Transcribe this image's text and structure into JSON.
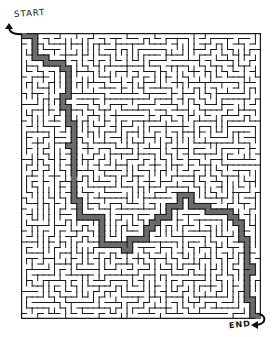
{
  "puzzle": {
    "type": "maze",
    "start_label": "START",
    "end_label": "END",
    "grid": {
      "cols": 43,
      "rows": 52,
      "seed": 7
    },
    "colors": {
      "wall": "#1a1a1a",
      "solution_path": "#6b6b6b",
      "background": "#ffffff"
    },
    "solution_waypoints": [
      [
        0,
        0
      ],
      [
        2,
        0
      ],
      [
        2,
        3
      ],
      [
        4,
        4
      ],
      [
        6,
        5
      ],
      [
        7,
        5
      ],
      [
        8,
        6
      ],
      [
        8,
        9
      ],
      [
        7,
        12
      ],
      [
        8,
        14
      ],
      [
        9,
        17
      ],
      [
        8,
        20
      ],
      [
        9,
        23
      ],
      [
        9,
        27
      ],
      [
        10,
        31
      ],
      [
        13,
        33
      ],
      [
        14,
        35
      ],
      [
        16,
        38
      ],
      [
        18,
        39
      ],
      [
        21,
        37
      ],
      [
        23,
        35
      ],
      [
        25,
        33
      ],
      [
        27,
        31
      ],
      [
        29,
        29
      ],
      [
        31,
        31
      ],
      [
        33,
        31
      ],
      [
        35,
        32
      ],
      [
        37,
        33
      ],
      [
        39,
        35
      ],
      [
        40,
        38
      ],
      [
        41,
        42
      ],
      [
        40,
        46
      ],
      [
        41,
        49
      ],
      [
        42,
        51
      ]
    ]
  }
}
